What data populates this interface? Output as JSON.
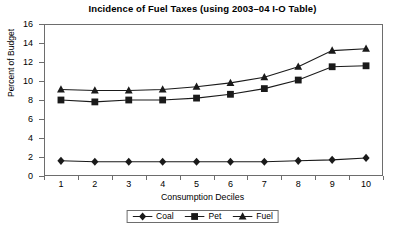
{
  "chart_data": {
    "type": "line",
    "title": "Incidence of Fuel Taxes (using 2003–04 I-O Table)",
    "xlabel": "Consumption Deciles",
    "ylabel": "Percent of Budget",
    "categories": [
      "1",
      "2",
      "3",
      "4",
      "5",
      "6",
      "7",
      "8",
      "9",
      "10"
    ],
    "x": [
      1,
      2,
      3,
      4,
      5,
      6,
      7,
      8,
      9,
      10
    ],
    "ylim": [
      0,
      16
    ],
    "yticks": [
      0,
      2,
      4,
      6,
      8,
      10,
      12,
      14,
      16
    ],
    "grid": false,
    "legend_position": "bottom",
    "series": [
      {
        "name": "Coal",
        "marker": "diamond",
        "values": [
          1.6,
          1.5,
          1.5,
          1.5,
          1.5,
          1.5,
          1.5,
          1.6,
          1.7,
          1.9
        ]
      },
      {
        "name": "Pet",
        "marker": "square",
        "values": [
          8.0,
          7.8,
          8.0,
          8.0,
          8.2,
          8.6,
          9.2,
          10.1,
          11.5,
          11.6
        ]
      },
      {
        "name": "Fuel",
        "marker": "triangle",
        "values": [
          9.1,
          9.0,
          9.0,
          9.1,
          9.4,
          9.8,
          10.4,
          11.5,
          13.2,
          13.4
        ]
      }
    ]
  },
  "colors": {
    "line": "#1a1a1a",
    "axis": "#6d6d6d",
    "background": "#ffffff",
    "text": "#000000"
  }
}
